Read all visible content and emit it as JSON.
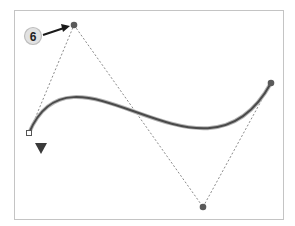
{
  "figure": {
    "callout": {
      "label": "6",
      "target": "top-control-point"
    },
    "points": {
      "start_anchor": "hollow-square",
      "top_control": "filled-circle",
      "bottom_control": "filled-circle",
      "end_point": "filled-circle"
    },
    "marker": {
      "icon": "down-triangle-icon"
    },
    "colors": {
      "curve": "#4a4a4a",
      "handle": "#8a8a8a",
      "frame": "#c4c4c4",
      "badge_fill": "#e2e2e2"
    }
  }
}
